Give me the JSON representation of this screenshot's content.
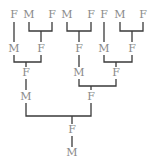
{
  "diagram": {
    "type": "ancestry-tree",
    "colors": {
      "label": "#8a8a8a",
      "line": "#3a3a3a",
      "background": "#ffffff"
    },
    "nodes": [
      {
        "id": "n1",
        "label": "F",
        "x": 14,
        "y": 18
      },
      {
        "id": "n2",
        "label": "M",
        "x": 29,
        "y": 18
      },
      {
        "id": "n3",
        "label": "F",
        "x": 52,
        "y": 18
      },
      {
        "id": "n4",
        "label": "M",
        "x": 67,
        "y": 18
      },
      {
        "id": "n5",
        "label": "F",
        "x": 91,
        "y": 18
      },
      {
        "id": "n6",
        "label": "F",
        "x": 104,
        "y": 18
      },
      {
        "id": "n7",
        "label": "M",
        "x": 120,
        "y": 18
      },
      {
        "id": "n8",
        "label": "F",
        "x": 143,
        "y": 18
      },
      {
        "id": "n9",
        "label": "M",
        "x": 14,
        "y": 52
      },
      {
        "id": "n10",
        "label": "F",
        "x": 41,
        "y": 52
      },
      {
        "id": "n11",
        "label": "F",
        "x": 79,
        "y": 52
      },
      {
        "id": "n12",
        "label": "M",
        "x": 104,
        "y": 52
      },
      {
        "id": "n13",
        "label": "F",
        "x": 132,
        "y": 52
      },
      {
        "id": "n14",
        "label": "F",
        "x": 26,
        "y": 76
      },
      {
        "id": "n15",
        "label": "M",
        "x": 79,
        "y": 76
      },
      {
        "id": "n16",
        "label": "F",
        "x": 116,
        "y": 76
      },
      {
        "id": "n17",
        "label": "M",
        "x": 26,
        "y": 100
      },
      {
        "id": "n18",
        "label": "F",
        "x": 91,
        "y": 100
      },
      {
        "id": "n19",
        "label": "F",
        "x": 72,
        "y": 133
      },
      {
        "id": "n20",
        "label": "M",
        "x": 72,
        "y": 156
      }
    ]
  }
}
